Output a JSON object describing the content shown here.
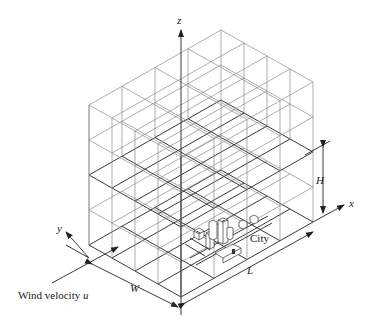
{
  "diagram": {
    "type": "isometric-3d-grid",
    "grid": {
      "cells_x": 4,
      "cells_y": 4,
      "layers_z": 4,
      "mixing_height_layer": 2
    },
    "labels": {
      "z_axis": "z",
      "x_axis": "x",
      "y_axis": "y",
      "height": "H",
      "length": "L",
      "width": "W",
      "city": "City",
      "wind_prefix": "Wind velocity ",
      "wind_var": "u"
    },
    "colors": {
      "grid": "#8a8a8a",
      "bold_plane": "#3a3a3a",
      "ink": "#222222",
      "background": "#ffffff"
    }
  }
}
